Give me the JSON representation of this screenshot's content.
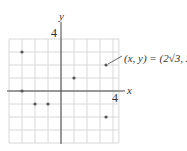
{
  "chart_data": {
    "type": "scatter",
    "title": "",
    "xlabel": "x",
    "ylabel": "y",
    "x_tick_labels": [
      "4"
    ],
    "y_tick_labels": [
      "4"
    ],
    "xlim": [
      -4,
      4.3
    ],
    "ylim": [
      -4,
      4
    ],
    "grid": true,
    "grid_step": 1,
    "points": [
      {
        "x": -3,
        "y": 3
      },
      {
        "x": -3,
        "y": 0
      },
      {
        "x": -2,
        "y": -1
      },
      {
        "x": -1,
        "y": -1
      },
      {
        "x": 1,
        "y": 1
      },
      {
        "x": 3.464,
        "y": 2
      },
      {
        "x": 3.464,
        "y": -2
      }
    ],
    "annotations": [
      {
        "text": "(x, y) = (2√3, 2)",
        "point": {
          "x": 3.464,
          "y": 2
        }
      }
    ]
  },
  "labels": {
    "x_axis": "x",
    "y_axis": "y",
    "x_tick": "4",
    "y_tick": "4",
    "annotation": "(x, y) = (2√3, 2)"
  },
  "colors": {
    "grid": "#d8d8d8",
    "axis": "#444444",
    "point": "#555555"
  }
}
